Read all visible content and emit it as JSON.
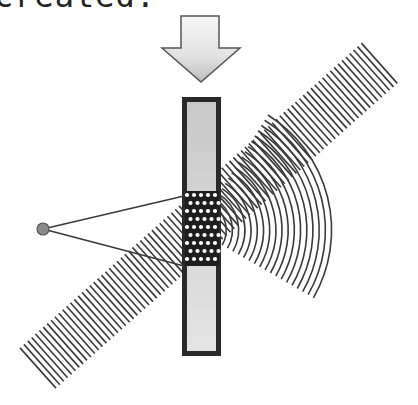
{
  "caption": "created.",
  "colors": {
    "line": "#3a3a3a",
    "plate_border": "#2a2a2a",
    "plate_fill_top": "#c8c8c8",
    "plate_fill_bottom": "#e4e4e4",
    "arrow_stroke": "#555555",
    "source_fill": "#8a8a8a",
    "background": "#ffffff"
  },
  "arrow": {
    "shaft": {
      "x1": 181,
      "x2": 219,
      "y1": 16,
      "y2": 48
    },
    "head": {
      "x1": 162,
      "x2": 240,
      "tip_y": 82
    }
  },
  "plate": {
    "x": 182,
    "y": 97,
    "width": 39,
    "height": 259,
    "border": 5
  },
  "source": {
    "cx": 43,
    "cy": 229,
    "r": 6
  },
  "rays": [
    {
      "x1": 43,
      "y1": 229,
      "x2": 184,
      "y2": 196
    },
    {
      "x1": 43,
      "y1": 229,
      "x2": 184,
      "y2": 266
    }
  ],
  "plane_wave": {
    "start": [
      38,
      368
    ],
    "end": [
      383,
      60
    ],
    "half_length": 27,
    "spacing": 5.2
  },
  "spherical_wave": {
    "center": [
      196,
      230
    ],
    "r_min": 24,
    "r_max": 140,
    "spacing": 6.2
  },
  "hologram_dots": {
    "x0": 188,
    "x1": 216,
    "y0": 195,
    "y1": 262,
    "dx": 7,
    "dy": 8
  }
}
